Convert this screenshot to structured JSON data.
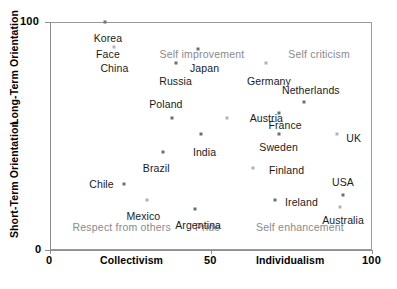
{
  "chart_data": {
    "type": "scatter",
    "title": "",
    "xlabel": "Collectivism / Individualism",
    "ylabel": "Short-Term Orientation / Long-Term Orientation",
    "xlim": [
      0,
      100
    ],
    "ylim": [
      0,
      100
    ],
    "grid": false,
    "legend": "none",
    "x_axis": {
      "ticks": [
        0,
        50,
        100
      ],
      "tick_labels": [
        "0",
        "50",
        "100"
      ],
      "left_title": "Collectivism",
      "right_title": "Individualism"
    },
    "y_axis": {
      "ticks": [
        0,
        100
      ],
      "tick_labels": [
        "0",
        "100"
      ],
      "upper_title": "Long-Term Orientation",
      "lower_title": "Short-Term Orientation"
    },
    "quadrant_labels": [
      {
        "text": "Self improvement",
        "x": 34,
        "y": 86
      },
      {
        "text": "Self criticism",
        "x": 74,
        "y": 86
      },
      {
        "text": "Respect from others",
        "x": 7,
        "y": 10
      },
      {
        "text": "Pride",
        "x": 45,
        "y": 10
      },
      {
        "text": "Self enhancement",
        "x": 64,
        "y": 10
      }
    ],
    "points": [
      {
        "name": "Korea",
        "x": 17,
        "y": 100,
        "label_x": 18,
        "label_y": 93,
        "label_align": "center"
      },
      {
        "name": "Face",
        "x": null,
        "y": null,
        "label_x": 18,
        "label_y": 86,
        "label_align": "center"
      },
      {
        "name": "China",
        "x": 20,
        "y": 89,
        "label_x": 20,
        "label_y": 80,
        "label_align": "center"
      },
      {
        "name": "Russia",
        "x": 39,
        "y": 82,
        "label_x": 39,
        "label_y": 74,
        "label_align": "center"
      },
      {
        "name": "Japan",
        "x": 46,
        "y": 88,
        "label_x": 48,
        "label_y": 80,
        "label_align": "center"
      },
      {
        "name": "Germany",
        "x": 67,
        "y": 82,
        "label_x": 68,
        "label_y": 74,
        "label_align": "center"
      },
      {
        "name": "Netherlands",
        "x": 79,
        "y": 65,
        "label_x": 81,
        "label_y": 70,
        "label_align": "center"
      },
      {
        "name": "Poland",
        "x": 38,
        "y": 58,
        "label_x": 36,
        "label_y": 64,
        "label_align": "center"
      },
      {
        "name": "Austria",
        "x": 55,
        "y": 58,
        "label_x": 62,
        "label_y": 58,
        "label_align": "left"
      },
      {
        "name": "France",
        "x": 71,
        "y": 60,
        "label_x": 73,
        "label_y": 55,
        "label_align": "center"
      },
      {
        "name": "Sweden",
        "x": 71,
        "y": 51,
        "label_x": 71,
        "label_y": 45,
        "label_align": "center"
      },
      {
        "name": "UK",
        "x": 89,
        "y": 51,
        "label_x": 92,
        "label_y": 49,
        "label_align": "left"
      },
      {
        "name": "India",
        "x": 47,
        "y": 51,
        "label_x": 48,
        "label_y": 43,
        "label_align": "center"
      },
      {
        "name": "Brazil",
        "x": 35,
        "y": 43,
        "label_x": 33,
        "label_y": 36,
        "label_align": "center"
      },
      {
        "name": "Finland",
        "x": 63,
        "y": 36,
        "label_x": 68,
        "label_y": 35,
        "label_align": "left"
      },
      {
        "name": "Chile",
        "x": 23,
        "y": 29,
        "label_x": 16,
        "label_y": 29,
        "label_align": "center"
      },
      {
        "name": "USA",
        "x": 91,
        "y": 24,
        "label_x": 91,
        "label_y": 30,
        "label_align": "center"
      },
      {
        "name": "Mexico",
        "x": 30,
        "y": 22,
        "label_x": 29,
        "label_y": 15,
        "label_align": "center"
      },
      {
        "name": "Ireland",
        "x": 70,
        "y": 22,
        "label_x": 73,
        "label_y": 21,
        "label_align": "left"
      },
      {
        "name": "Argentina",
        "x": 45,
        "y": 18,
        "label_x": 46,
        "label_y": 11,
        "label_align": "center"
      },
      {
        "name": "Australia",
        "x": 90,
        "y": 19,
        "label_x": 91,
        "label_y": 13,
        "label_align": "center"
      }
    ]
  }
}
